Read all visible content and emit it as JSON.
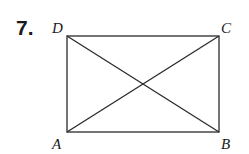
{
  "problem": {
    "number": "7."
  },
  "figure": {
    "shape": "rectangle",
    "vertices": {
      "A": {
        "label": "A",
        "x": 67,
        "y": 132
      },
      "B": {
        "label": "B",
        "x": 219,
        "y": 132
      },
      "C": {
        "label": "C",
        "x": 219,
        "y": 36
      },
      "D": {
        "label": "D",
        "x": 67,
        "y": 36
      }
    },
    "segments": [
      "AB",
      "BC",
      "CD",
      "DA",
      "AC",
      "BD"
    ],
    "stroke_color": "#2a2a2a"
  }
}
